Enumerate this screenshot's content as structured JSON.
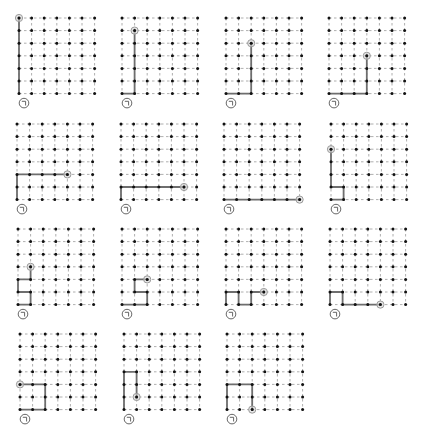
{
  "grid": {
    "cols": 7,
    "rows": 7
  },
  "colors": {
    "dot": "#111111",
    "gridline": "#9a9a9a",
    "path": "#6e6e6e",
    "endpoint": "#9a9a9a",
    "start_marker": "#555555"
  },
  "start_marker_icon": "start-corner-icon",
  "panels": [
    {
      "id": 1,
      "path": [
        [
          0,
          0
        ],
        [
          0,
          6
        ]
      ],
      "end": [
        0,
        6
      ]
    },
    {
      "id": 2,
      "path": [
        [
          0,
          0
        ],
        [
          1,
          0
        ],
        [
          1,
          5
        ]
      ],
      "end": [
        1,
        5
      ]
    },
    {
      "id": 3,
      "path": [
        [
          0,
          0
        ],
        [
          2,
          0
        ],
        [
          2,
          4
        ]
      ],
      "end": [
        2,
        4
      ]
    },
    {
      "id": 4,
      "path": [
        [
          0,
          0
        ],
        [
          3,
          0
        ],
        [
          3,
          3
        ]
      ],
      "end": [
        3,
        3
      ]
    },
    {
      "id": 5,
      "path": [
        [
          0,
          0
        ],
        [
          0,
          2
        ],
        [
          4,
          2
        ]
      ],
      "end": [
        4,
        2
      ]
    },
    {
      "id": 6,
      "path": [
        [
          0,
          0
        ],
        [
          0,
          1
        ],
        [
          5,
          1
        ]
      ],
      "end": [
        5,
        1
      ]
    },
    {
      "id": 7,
      "path": [
        [
          0,
          0
        ],
        [
          6,
          0
        ]
      ],
      "end": [
        6,
        0
      ]
    },
    {
      "id": 8,
      "path": [
        [
          0,
          0
        ],
        [
          1,
          0
        ],
        [
          1,
          1
        ],
        [
          0,
          1
        ],
        [
          0,
          4
        ]
      ],
      "end": [
        0,
        4
      ]
    },
    {
      "id": 9,
      "path": [
        [
          0,
          0
        ],
        [
          1,
          0
        ],
        [
          1,
          1
        ],
        [
          0,
          1
        ],
        [
          0,
          2
        ],
        [
          1,
          2
        ],
        [
          1,
          3
        ]
      ],
      "end": [
        1,
        3
      ]
    },
    {
      "id": 10,
      "path": [
        [
          0,
          0
        ],
        [
          2,
          0
        ],
        [
          2,
          1
        ],
        [
          1,
          1
        ],
        [
          1,
          2
        ],
        [
          2,
          2
        ]
      ],
      "end": [
        2,
        2
      ]
    },
    {
      "id": 11,
      "path": [
        [
          0,
          0
        ],
        [
          0,
          1
        ],
        [
          1,
          1
        ],
        [
          1,
          0
        ],
        [
          2,
          0
        ],
        [
          2,
          1
        ],
        [
          3,
          1
        ]
      ],
      "end": [
        3,
        1
      ]
    },
    {
      "id": 12,
      "path": [
        [
          0,
          0
        ],
        [
          0,
          1
        ],
        [
          1,
          1
        ],
        [
          1,
          0
        ],
        [
          4,
          0
        ]
      ],
      "end": [
        4,
        0
      ]
    },
    {
      "id": 13,
      "path": [
        [
          0,
          0
        ],
        [
          2,
          0
        ],
        [
          2,
          2
        ],
        [
          0,
          2
        ]
      ],
      "end": [
        0,
        2
      ]
    },
    {
      "id": 14,
      "path": [
        [
          0,
          0
        ],
        [
          0,
          3
        ],
        [
          1,
          3
        ],
        [
          1,
          1
        ]
      ],
      "end": [
        1,
        1
      ]
    },
    {
      "id": 15,
      "path": [
        [
          0,
          0
        ],
        [
          0,
          2
        ],
        [
          2,
          2
        ],
        [
          2,
          0
        ]
      ],
      "end": [
        2,
        0
      ]
    }
  ]
}
